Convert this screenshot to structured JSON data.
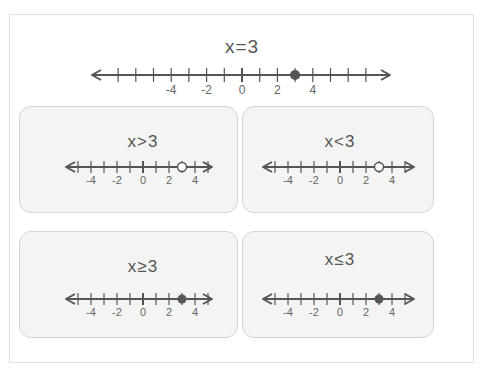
{
  "colors": {
    "line": "#555555",
    "point": "#555555",
    "card_bg": "#f4f4f4",
    "card_border": "#d4d4d4",
    "text": "#555555"
  },
  "chart_data": [
    {
      "type": "number-line",
      "title": "x = 3",
      "relation": "=",
      "value": 3,
      "point": "closed",
      "shade": "none",
      "range": [
        -7,
        7
      ],
      "tick_labels": [
        "-4",
        "-2",
        "0",
        "2",
        "4"
      ],
      "labeled_ticks": [
        -4,
        -2,
        0,
        2,
        4
      ]
    },
    {
      "type": "number-line",
      "title": "x > 3",
      "relation": ">",
      "value": 3,
      "point": "open",
      "shade": "right",
      "range": [
        -5,
        5
      ],
      "tick_labels": [
        "-4",
        "-2",
        "0",
        "2",
        "4"
      ],
      "labeled_ticks": [
        -4,
        -2,
        0,
        2,
        4
      ]
    },
    {
      "type": "number-line",
      "title": "x < 3",
      "relation": "<",
      "value": 3,
      "point": "open",
      "shade": "left",
      "range": [
        -5,
        5
      ],
      "tick_labels": [
        "-4",
        "-2",
        "0",
        "2",
        "4"
      ],
      "labeled_ticks": [
        -4,
        -2,
        0,
        2,
        4
      ]
    },
    {
      "type": "number-line",
      "title": "x ≥ 3",
      "relation": "≥",
      "value": 3,
      "point": "closed",
      "shade": "right",
      "range": [
        -5,
        5
      ],
      "tick_labels": [
        "-4",
        "-2",
        "0",
        "2",
        "4"
      ],
      "labeled_ticks": [
        -4,
        -2,
        0,
        2,
        4
      ]
    },
    {
      "type": "number-line",
      "title": "x ≤ 3",
      "relation": "≤",
      "value": 3,
      "point": "closed",
      "shade": "left",
      "range": [
        -5,
        5
      ],
      "tick_labels": [
        "-4",
        "-2",
        "0",
        "2",
        "4"
      ],
      "labeled_ticks": [
        -4,
        -2,
        0,
        2,
        4
      ]
    }
  ],
  "lines": {
    "main": {
      "title": "x=3",
      "zero_x": 242,
      "y": 75,
      "step": 17.7,
      "left": 92,
      "right": 390,
      "title_y": 36,
      "tick_h": 7,
      "label_dy": 16,
      "font": 12,
      "r": 5
    },
    "gt": {
      "title": "x>3",
      "zero_x": 143,
      "y": 167,
      "step": 13,
      "left": 66,
      "right": 212,
      "title_y": 133,
      "tick_h": 6,
      "label_dy": 14,
      "font": 11,
      "r": 4.5
    },
    "lt": {
      "title": "x<3",
      "zero_x": 340,
      "y": 167,
      "step": 13,
      "left": 263,
      "right": 414,
      "title_y": 133,
      "tick_h": 6,
      "label_dy": 14,
      "font": 11,
      "r": 4.5
    },
    "ge": {
      "title": "x≥3",
      "zero_x": 143,
      "y": 299,
      "step": 13,
      "left": 66,
      "right": 212,
      "title_y": 258,
      "tick_h": 6,
      "label_dy": 14,
      "font": 11,
      "r": 4.5
    },
    "le": {
      "title": "x≤3",
      "zero_x": 340,
      "y": 299,
      "step": 13,
      "left": 263,
      "right": 414,
      "title_y": 251,
      "tick_h": 6,
      "label_dy": 14,
      "font": 11,
      "r": 4.5
    }
  },
  "cards": [
    {
      "key": "gt",
      "x": 19,
      "y": 106,
      "w": 219,
      "h": 107
    },
    {
      "key": "lt",
      "x": 242,
      "y": 106,
      "w": 192,
      "h": 107
    },
    {
      "key": "ge",
      "x": 19,
      "y": 231,
      "w": 219,
      "h": 107
    },
    {
      "key": "le",
      "x": 242,
      "y": 231,
      "w": 192,
      "h": 107
    }
  ]
}
